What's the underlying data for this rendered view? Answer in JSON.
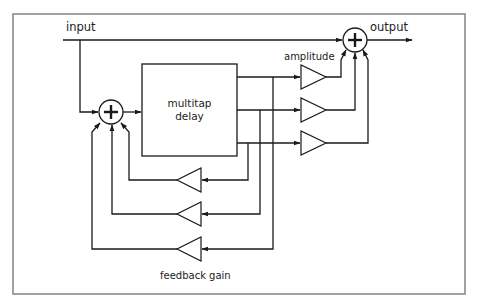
{
  "diagram": {
    "labels": {
      "input": "input",
      "output": "output",
      "amplitude": "amplitude",
      "feedback_gain": "feedback gain",
      "delay_line1": "multitap",
      "delay_line2": "delay"
    },
    "nodes": [
      {
        "id": "input",
        "type": "signal-source",
        "label": "input"
      },
      {
        "id": "sum-in",
        "type": "summing-junction",
        "symbol": "+"
      },
      {
        "id": "delay",
        "type": "block",
        "label": "multitap delay",
        "taps": 3
      },
      {
        "id": "amp-1",
        "type": "gain",
        "group": "amplitude"
      },
      {
        "id": "amp-2",
        "type": "gain",
        "group": "amplitude"
      },
      {
        "id": "amp-3",
        "type": "gain",
        "group": "amplitude"
      },
      {
        "id": "fb-1",
        "type": "gain",
        "group": "feedback gain"
      },
      {
        "id": "fb-2",
        "type": "gain",
        "group": "feedback gain"
      },
      {
        "id": "fb-3",
        "type": "gain",
        "group": "feedback gain"
      },
      {
        "id": "sum-out",
        "type": "summing-junction",
        "symbol": "+"
      },
      {
        "id": "output",
        "type": "signal-sink",
        "label": "output"
      }
    ],
    "edges": [
      {
        "from": "input",
        "to": "sum-out"
      },
      {
        "from": "input",
        "to": "sum-in"
      },
      {
        "from": "sum-in",
        "to": "delay"
      },
      {
        "from": "delay.tap1",
        "to": "amp-1"
      },
      {
        "from": "delay.tap2",
        "to": "amp-2"
      },
      {
        "from": "delay.tap3",
        "to": "amp-3"
      },
      {
        "from": "amp-1",
        "to": "sum-out"
      },
      {
        "from": "amp-2",
        "to": "sum-out"
      },
      {
        "from": "amp-3",
        "to": "sum-out"
      },
      {
        "from": "delay.tap3",
        "to": "fb-1"
      },
      {
        "from": "delay.tap2",
        "to": "fb-2"
      },
      {
        "from": "delay.tap1",
        "to": "fb-3"
      },
      {
        "from": "fb-1",
        "to": "sum-in"
      },
      {
        "from": "fb-2",
        "to": "sum-in"
      },
      {
        "from": "fb-3",
        "to": "sum-in"
      },
      {
        "from": "sum-out",
        "to": "output"
      }
    ],
    "colors": {
      "line": "#1a1a1a",
      "frame": "#8a8a8a",
      "background": "#ffffff"
    }
  }
}
